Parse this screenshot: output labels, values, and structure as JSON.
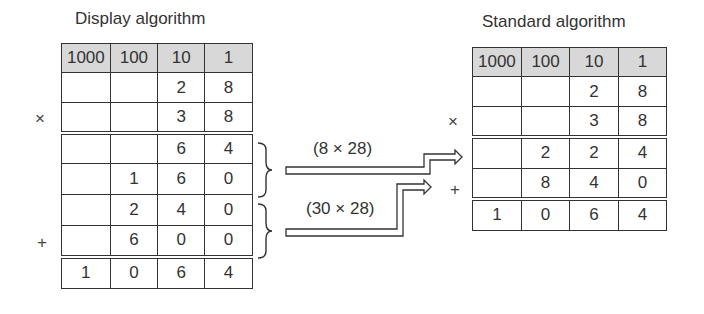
{
  "left": {
    "title": "Display algorithm",
    "headers": [
      "1000",
      "100",
      "10",
      "1"
    ],
    "rows": [
      [
        "",
        "",
        "2",
        "8"
      ],
      [
        "",
        "",
        "3",
        "8"
      ],
      [
        "",
        "",
        "6",
        "4"
      ],
      [
        "",
        "1",
        "6",
        "0"
      ],
      [
        "",
        "2",
        "4",
        "0"
      ],
      [
        "",
        "6",
        "0",
        "0"
      ],
      [
        "1",
        "0",
        "6",
        "4"
      ]
    ],
    "times_sign": "×",
    "plus_sign": "+"
  },
  "right": {
    "title": "Standard algorithm",
    "headers": [
      "1000",
      "100",
      "10",
      "1"
    ],
    "rows": [
      [
        "",
        "",
        "2",
        "8"
      ],
      [
        "",
        "",
        "3",
        "8"
      ],
      [
        "",
        "2",
        "2",
        "4"
      ],
      [
        "",
        "8",
        "4",
        "0"
      ],
      [
        "1",
        "0",
        "6",
        "4"
      ]
    ],
    "times_sign": "×",
    "plus_sign": "+"
  },
  "arrows": {
    "upper_label": "(8 × 28)",
    "lower_label": "(30 × 28)"
  }
}
